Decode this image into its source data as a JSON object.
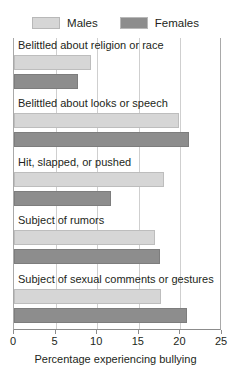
{
  "chart_data": {
    "type": "bar",
    "orientation": "horizontal",
    "title": "",
    "xlabel": "Percentage experiencing bullying",
    "ylabel": "",
    "xlim": [
      0,
      25
    ],
    "xticks": [
      0,
      5,
      10,
      15,
      20,
      25
    ],
    "grid": true,
    "legend_position": "top",
    "categories": [
      "Belittled about religion or race",
      "Belittled about looks or speech",
      "Hit, slapped, or pushed",
      "Subject of rumors",
      "Subject of sexual comments or gestures"
    ],
    "series": [
      {
        "name": "Males",
        "color": "#d6d6d6",
        "values": [
          9.3,
          19.8,
          18.0,
          17.0,
          17.7
        ]
      },
      {
        "name": "Females",
        "color": "#8d8d8d",
        "values": [
          7.7,
          21.0,
          11.7,
          17.5,
          20.8
        ]
      }
    ]
  },
  "legend": {
    "entries": [
      {
        "label": "Males"
      },
      {
        "label": "Females"
      }
    ]
  },
  "axis": {
    "tick_labels": [
      "0",
      "5",
      "10",
      "15",
      "20",
      "25"
    ],
    "title": "Percentage experiencing bullying"
  }
}
